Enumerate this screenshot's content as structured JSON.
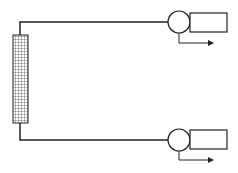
{
  "diagram": {
    "title": "",
    "colors": {
      "stroke": "#222222",
      "background": "#ffffff",
      "grid": "#555555"
    },
    "column": {
      "label": "",
      "x": 13,
      "y": 35,
      "width": 15,
      "height": 88
    },
    "outlets": [
      {
        "id": "top",
        "line_y": 22,
        "circle": {
          "cx": 179,
          "cy": 22,
          "r": 11
        },
        "rect": {
          "x": 190,
          "y": 13,
          "w": 37,
          "h": 19
        },
        "arrow_y": 43
      },
      {
        "id": "bottom",
        "line_y": 140,
        "circle": {
          "cx": 179,
          "cy": 140,
          "r": 11
        },
        "rect": {
          "x": 190,
          "y": 130,
          "w": 37,
          "h": 19
        },
        "arrow_y": 160
      }
    ]
  }
}
